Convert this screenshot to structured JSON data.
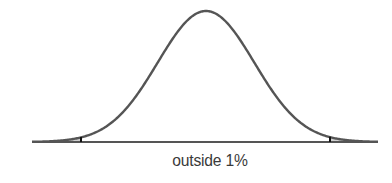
{
  "figure": {
    "caption": "outside 1%",
    "curve_color": "#555555",
    "shade_color": "#cfcfcf",
    "tick_color": "#111111"
  },
  "chart_data": {
    "type": "area",
    "title": "",
    "distribution": "normal",
    "mean_px": 206,
    "sigma_px": 48.3,
    "peak_y_px": 11,
    "baseline_y_px": 142,
    "baseline_x_range_px": [
      32,
      378
    ],
    "critical_z": [
      -2.576,
      2.576
    ],
    "critical_x_px": [
      81,
      330
    ],
    "shaded_regions": [
      "left tail (z < -2.576)",
      "right tail (z > 2.576)"
    ],
    "shaded_area_total": "1%",
    "annotation": "outside 1%",
    "xlabel": "",
    "ylabel": "",
    "grid": false,
    "legend": null
  }
}
